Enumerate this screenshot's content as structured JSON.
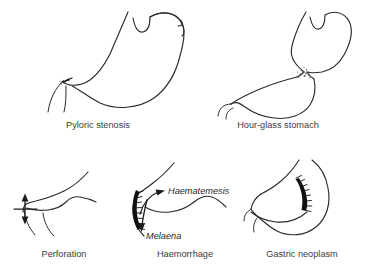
{
  "figure": {
    "background_color": "#ffffff",
    "outline_color": "#2b2b2b",
    "lesion_color": "#111111",
    "caption_color": "#3d3d3d",
    "annotation_color": "#1f1f1f"
  },
  "panels": [
    {
      "id": "pyloric-stenosis",
      "caption": "Pyloric stenosis",
      "row": 1,
      "column": 1,
      "marker": "arrow-at-pylorus",
      "annotations": []
    },
    {
      "id": "hour-glass-stomach",
      "caption": "Hour-glass stomach",
      "row": 1,
      "column": 2,
      "marker": "stippled-mid-constriction",
      "annotations": []
    },
    {
      "id": "perforation",
      "caption": "Perforation",
      "row": 2,
      "column": 1,
      "marker": "double-headed-arrow",
      "annotations": []
    },
    {
      "id": "haemorrhage",
      "caption": "Haemorrhage",
      "row": 2,
      "column": 2,
      "marker": "hatched-bleeding-ulcer",
      "annotations": [
        "Haematemesis",
        "Melaena"
      ]
    },
    {
      "id": "gastric-neoplasm",
      "caption": "Gastric neoplasm",
      "row": 2,
      "column": 3,
      "marker": "hatched-tumour-mass",
      "annotations": []
    }
  ],
  "annotations": {
    "haematemesis": "Haematemesis",
    "melaena": "Melaena"
  }
}
